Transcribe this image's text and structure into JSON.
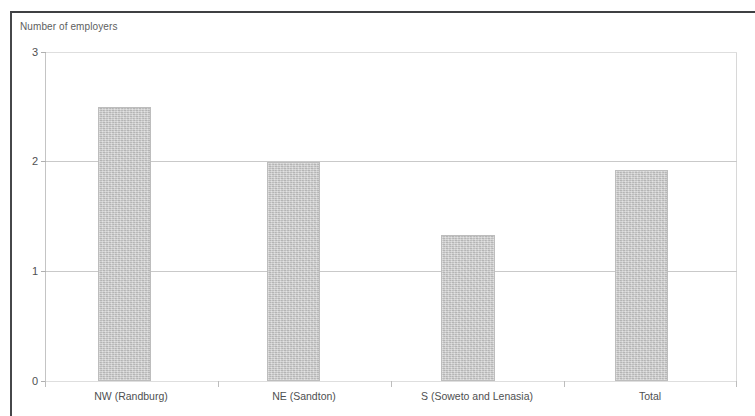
{
  "chart_data": {
    "type": "bar",
    "title": "",
    "xlabel": "",
    "ylabel": "Number of employers",
    "categories": [
      "NW (Randburg)",
      "NE (Sandton)",
      "S (Soweto and Lenasia)",
      "Total"
    ],
    "values": [
      2.5,
      2.0,
      1.33,
      1.92
    ],
    "yticks": [
      "0",
      "1",
      "2",
      "3"
    ],
    "ylim": [
      0,
      3
    ],
    "grid": true,
    "legend": null,
    "series": [
      {
        "name": "Number of employers",
        "values": [
          2.5,
          2.0,
          1.33,
          1.92
        ]
      }
    ],
    "colors": {
      "bar_fill": "#c9c9c9",
      "bar_border": "#bdbdbd",
      "gridline": "#c9c9c9",
      "text": "#4f5052",
      "frame": "#46474a"
    }
  },
  "axis": {
    "y_title": "Number of employers"
  }
}
